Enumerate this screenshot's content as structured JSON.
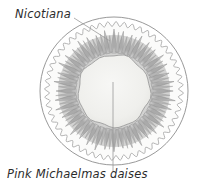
{
  "figure": {
    "kind": "planting-plan-diagram",
    "shape": "circular-bed",
    "background_color": "#ffffff"
  },
  "labels": {
    "outer_ring": "Nicotiana",
    "inner_ring": "Pink Michaelmas daises"
  },
  "leader_lines": {
    "nicotiana": {
      "from_x": 74,
      "from_y": 18,
      "to_x": 110,
      "to_y": 41
    },
    "daisies": {
      "from_x": 113,
      "from_y": 82,
      "to_x": 113,
      "to_y": 172
    },
    "color": "#9a9a9a"
  },
  "geometry": {
    "center_x": 114,
    "center_y": 91,
    "outer_circle_radius": 74,
    "scalloped_ring_radius": 67,
    "petal_outer_radius": 62,
    "petal_inner_radius": 38,
    "inner_disc_radius": 36,
    "scallop_count": 52,
    "petal_count": 40
  },
  "colors": {
    "outline": "#8d8d8d",
    "scallop_outline": "#9b9b9b",
    "petal_fill": "#b9b9b9",
    "petal_stroke": "#8f8f8f",
    "petal_shadow": "#a2a2a2",
    "inner_disc_fill": "#efefec",
    "inner_disc_stroke": "#9c9c9c",
    "label_text": "#2b2b2b"
  }
}
